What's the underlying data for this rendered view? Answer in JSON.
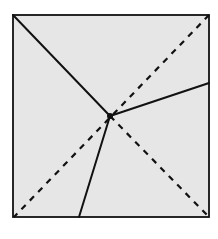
{
  "diagram": {
    "type": "folding-diagram",
    "colors": {
      "paper_fill": "#e6e6e6",
      "stroke": "#111111",
      "background": "#ffffff"
    },
    "square": {
      "x": 13,
      "y": 15,
      "width": 196,
      "height": 202
    },
    "junction": {
      "x": 110,
      "y": 116
    },
    "solid_lines": [
      {
        "name": "crease-top-left",
        "x1": 13,
        "y1": 15,
        "x2": 110,
        "y2": 116
      },
      {
        "name": "crease-right",
        "x1": 110,
        "y1": 116,
        "x2": 209,
        "y2": 83
      },
      {
        "name": "crease-bottom",
        "x1": 110,
        "y1": 116,
        "x2": 79,
        "y2": 217
      }
    ],
    "dashed_lines": [
      {
        "name": "fold-diagonal-tr-bl",
        "x1": 209,
        "y1": 15,
        "x2": 14,
        "y2": 217
      },
      {
        "name": "fold-diagonal-center-br",
        "x1": 110,
        "y1": 116,
        "x2": 209,
        "y2": 217
      }
    ]
  }
}
